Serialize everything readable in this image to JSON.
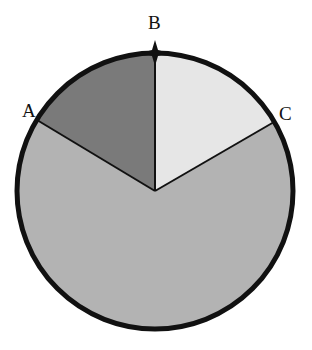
{
  "diagram": {
    "type": "circle-sectors",
    "center": [
      155,
      191
    ],
    "radius": 138,
    "points": [
      {
        "label": "A",
        "x": 37,
        "y": 120
      },
      {
        "label": "B",
        "x": 155,
        "y": 53
      },
      {
        "label": "C",
        "x": 274,
        "y": 122
      }
    ],
    "sectors": [
      {
        "name": "A-to-B",
        "color": "#7a7a7a"
      },
      {
        "name": "B-to-C",
        "color": "#e6e6e6"
      },
      {
        "name": "C-to-A",
        "color": "#b3b3b3"
      }
    ],
    "marker": {
      "at": "B",
      "shape": "star"
    }
  },
  "labels": {
    "a": "A",
    "b": "B",
    "c": "C"
  }
}
